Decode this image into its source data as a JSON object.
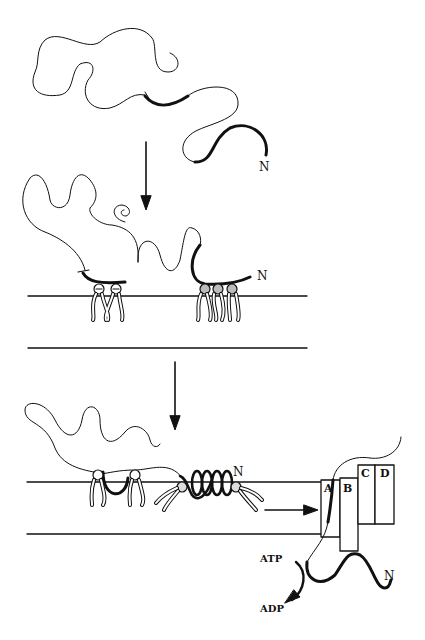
{
  "diagram": {
    "stage1": {
      "terminus_label": "N"
    },
    "stage2": {
      "terminus_label": "N",
      "lipid_charge_left": "−",
      "lipid_charge_right": "+"
    },
    "stage3": {
      "terminus_label": "N",
      "translocon_subunits": [
        "A",
        "B",
        "C",
        "D"
      ],
      "exit_terminus_label": "N",
      "energy_in": "ATP",
      "energy_out": "ADP"
    },
    "colors": {
      "line": "#111111",
      "background": "#ffffff"
    }
  }
}
